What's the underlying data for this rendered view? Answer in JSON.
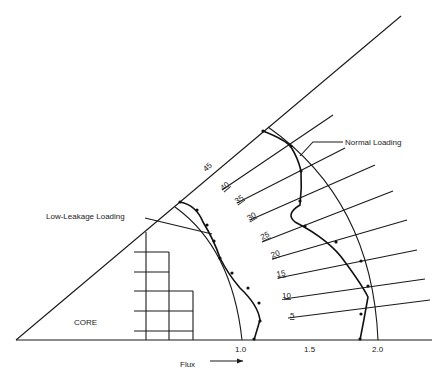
{
  "diagram": {
    "type": "radial flux distribution in core octant",
    "region_label": "CORE",
    "curve_labels": {
      "normal": "Normal Loading",
      "low_leakage": "Low-Leakage Loading"
    },
    "axis": {
      "label": "Flux",
      "arrow": "→",
      "ticks": [
        "1.0",
        "1.5",
        "2.0"
      ]
    },
    "angle_labels": [
      "5",
      "10",
      "15",
      "20",
      "25",
      "30",
      "35",
      "40",
      "45"
    ]
  }
}
